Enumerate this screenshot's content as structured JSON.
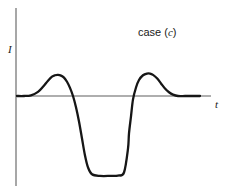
{
  "figure": {
    "annotation_prefix": "case (",
    "annotation_id": "c",
    "annotation_suffix": ")",
    "annotation_full": "case (c)",
    "background_color": "#ffffff",
    "curve_color": "#161616",
    "axis_color": "#5f5f5f"
  },
  "axes": {
    "y_label": "I",
    "x_label": "t",
    "y_axis_x": 16,
    "y_axis_top": 8,
    "y_axis_bottom": 186,
    "x_axis_y": 96,
    "x_axis_left": 16,
    "x_axis_right": 211
  },
  "chart_data": {
    "type": "line",
    "title": "case (c)",
    "xlabel": "t",
    "ylabel": "I",
    "grid": false,
    "legend": null,
    "xlim": [
      0,
      211
    ],
    "ylim": [
      -2.45,
      1.0
    ],
    "baseline": 0,
    "annotations": [
      {
        "text": "case (c)",
        "x": 160,
        "y": 0.92
      }
    ],
    "features": {
      "first_peak_x": 58,
      "first_peak_value": 0.62,
      "first_zero_crossing_x": 73,
      "trough_start_x": 88,
      "trough_end_x": 128,
      "trough_value": -2.35,
      "second_zero_crossing_x": 129,
      "second_peak_x": 150,
      "second_peak_value": 0.66,
      "settle_x": 180,
      "tail_end_x": 200
    },
    "x": [
      17,
      24,
      31,
      38,
      43,
      48,
      52,
      55,
      58,
      61,
      64,
      67,
      70,
      73,
      76,
      79,
      82,
      85,
      88,
      92,
      100,
      110,
      118,
      124,
      128,
      129,
      131,
      133,
      136,
      139,
      143,
      147,
      150,
      153,
      157,
      161,
      165,
      169,
      173,
      178,
      185,
      192,
      200
    ],
    "y": [
      0.0,
      0.0,
      0.02,
      0.12,
      0.27,
      0.45,
      0.57,
      0.61,
      0.62,
      0.6,
      0.54,
      0.42,
      0.24,
      0.0,
      -0.33,
      -0.75,
      -1.25,
      -1.75,
      -2.1,
      -2.3,
      -2.35,
      -2.35,
      -2.34,
      -2.25,
      -1.55,
      -1.1,
      -0.6,
      -0.1,
      0.25,
      0.47,
      0.61,
      0.66,
      0.66,
      0.62,
      0.52,
      0.37,
      0.22,
      0.11,
      0.04,
      0.0,
      0.0,
      0.0,
      0.0
    ]
  }
}
